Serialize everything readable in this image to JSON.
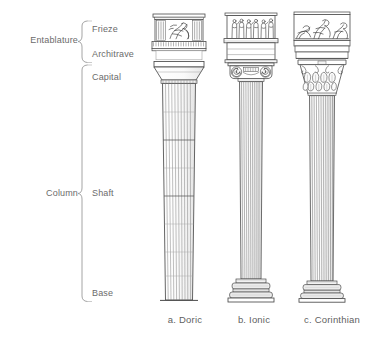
{
  "diagram": {
    "groups": [
      {
        "name": "entablature",
        "label": "Entablature"
      },
      {
        "name": "column",
        "label": "Column"
      }
    ],
    "parts": [
      {
        "name": "frieze",
        "label": "Frieze"
      },
      {
        "name": "architrave",
        "label": "Architrave"
      },
      {
        "name": "capital",
        "label": "Capital"
      },
      {
        "name": "shaft",
        "label": "Shaft"
      },
      {
        "name": "base",
        "label": "Base"
      }
    ],
    "orders": [
      {
        "key": "doric",
        "label": "a. Doric"
      },
      {
        "key": "ionic",
        "label": "b. Ionic"
      },
      {
        "key": "corinthian",
        "label": "c. Corinthian"
      }
    ],
    "colors": {
      "text": "#6b6b6b",
      "line": "#9a9a9a",
      "stroke": "#4a4a4a",
      "fill": "#ffffff",
      "shade": "#e9e9e9",
      "background": "#ffffff"
    }
  }
}
